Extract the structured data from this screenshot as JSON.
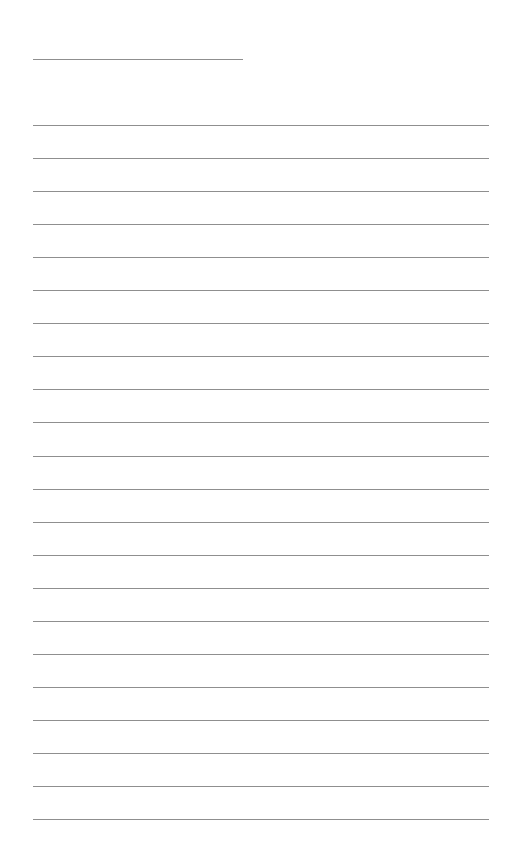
{
  "document": {
    "type": "lined-paper",
    "title_line": {
      "x": 33,
      "y": 59,
      "width": 210
    },
    "rules": {
      "count": 22,
      "start_y": 125,
      "spacing": 33.05,
      "x": 33,
      "width": 456,
      "color": "#8f8f8f"
    },
    "background": "#ffffff"
  }
}
